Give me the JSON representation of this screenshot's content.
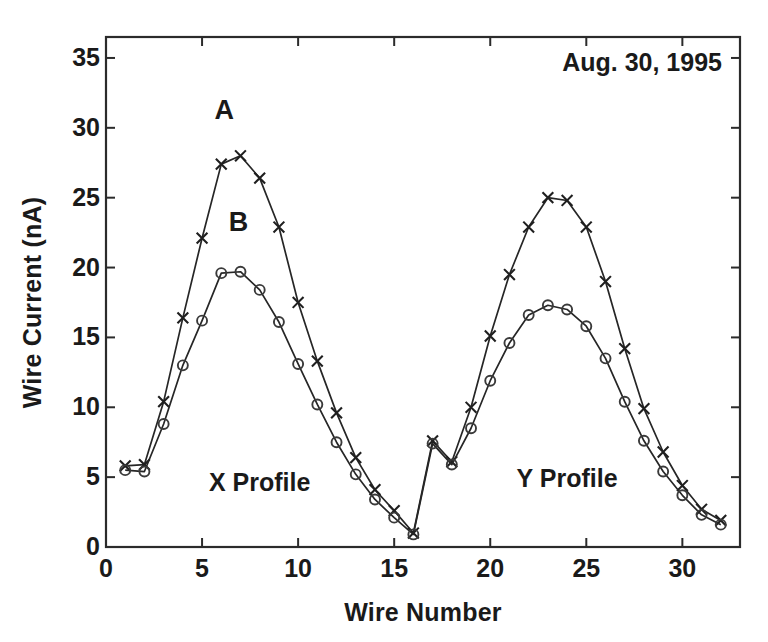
{
  "chart_data": {
    "type": "line",
    "title": "",
    "annotation_date": "Aug. 30, 1995",
    "xlabel": "Wire Number",
    "ylabel": "Wire Current (nA)",
    "xlim": [
      0,
      33
    ],
    "ylim": [
      0,
      36.5
    ],
    "xticks": [
      0,
      5,
      10,
      15,
      20,
      25,
      30
    ],
    "yticks": [
      0,
      5,
      10,
      15,
      20,
      25,
      30,
      35
    ],
    "xtick_labels": [
      "0",
      "5",
      "10",
      "15",
      "20",
      "25",
      "30"
    ],
    "ytick_labels": [
      "0",
      "5",
      "10",
      "15",
      "20",
      "25",
      "30",
      "35"
    ],
    "grid": false,
    "legend_position": "in-plot-labels",
    "region_labels": [
      {
        "text": "X Profile",
        "x": 8.0,
        "y": 4.0
      },
      {
        "text": "Y Profile",
        "x": 24.0,
        "y": 4.3
      }
    ],
    "series_tags": [
      {
        "text": "A",
        "x": 6.15,
        "y": 30.6
      },
      {
        "text": "B",
        "x": 6.9,
        "y": 22.6
      }
    ],
    "x": [
      1,
      2,
      3,
      4,
      5,
      6,
      7,
      8,
      9,
      10,
      11,
      12,
      13,
      14,
      15,
      16,
      17,
      18,
      19,
      20,
      21,
      22,
      23,
      24,
      25,
      26,
      27,
      28,
      29,
      30,
      31,
      32
    ],
    "series": [
      {
        "name": "A",
        "marker": "x",
        "values": [
          5.8,
          5.9,
          10.4,
          16.4,
          22.1,
          27.4,
          28.0,
          26.4,
          22.9,
          17.5,
          13.3,
          9.6,
          6.4,
          4.1,
          2.6,
          1.0,
          7.6,
          6.1,
          10.0,
          15.1,
          19.5,
          22.9,
          25.0,
          24.8,
          22.9,
          19.0,
          14.2,
          9.9,
          6.8,
          4.4,
          2.7,
          1.9
        ]
      },
      {
        "name": "B",
        "marker": "o",
        "values": [
          5.5,
          5.4,
          8.8,
          13.0,
          16.2,
          19.6,
          19.7,
          18.4,
          16.1,
          13.1,
          10.2,
          7.5,
          5.2,
          3.4,
          2.1,
          0.9,
          7.4,
          5.9,
          8.5,
          11.9,
          14.6,
          16.6,
          17.3,
          17.0,
          15.8,
          13.5,
          10.4,
          7.6,
          5.4,
          3.7,
          2.3,
          1.6
        ]
      }
    ]
  }
}
